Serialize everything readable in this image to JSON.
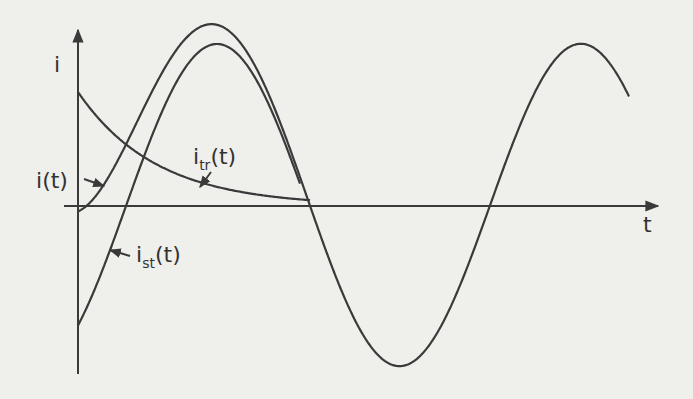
{
  "diagram": {
    "axis_labels": {
      "y": "i",
      "x": "t"
    },
    "curve_labels": {
      "total": {
        "base": "i",
        "sub": "",
        "arg": "(t)"
      },
      "transient": {
        "base": "i",
        "sub": "tr",
        "arg": "(t)"
      },
      "steady": {
        "base": "i",
        "sub": "st",
        "arg": "(t)"
      }
    },
    "colors": {
      "ink": "#3a3a3a",
      "paper": "#efefec"
    }
  },
  "chart_data": {
    "type": "line",
    "title": "",
    "xlabel": "t",
    "ylabel": "i",
    "grid": false,
    "legend": "inline labels with arrows",
    "units": "arbitrary (normalized: steady-state amplitude = 1, period = 1)",
    "x": [
      0.0,
      0.1,
      0.2,
      0.3,
      0.4,
      0.5,
      0.6,
      0.7,
      0.8,
      0.9,
      1.0,
      1.1,
      1.2,
      1.3,
      1.4,
      1.5
    ],
    "series": [
      {
        "name": "i_st(t)",
        "values": [
          -0.74,
          -0.04,
          0.68,
          0.99,
          0.79,
          0.11,
          -0.62,
          -0.98,
          -0.83,
          -0.18,
          0.55,
          0.96,
          0.87,
          0.25,
          -0.48,
          -0.93
        ]
      },
      {
        "name": "i_tr(t)",
        "values": [
          0.71,
          0.44,
          0.28,
          0.18,
          0.11,
          0.07,
          0.04,
          0.03,
          0.02,
          0.01,
          0.01,
          0.0,
          0.0,
          0.0,
          0.0,
          0.0
        ]
      },
      {
        "name": "i(t)",
        "values": [
          0.0,
          0.4,
          0.96,
          1.17,
          0.9,
          0.18,
          -0.58,
          -0.95,
          -0.81,
          -0.17,
          0.56,
          0.96,
          0.87,
          0.25,
          -0.48,
          -0.93
        ]
      }
    ],
    "ylim": [
      -1.3,
      1.2
    ],
    "xlim": [
      0,
      1.55
    ]
  }
}
